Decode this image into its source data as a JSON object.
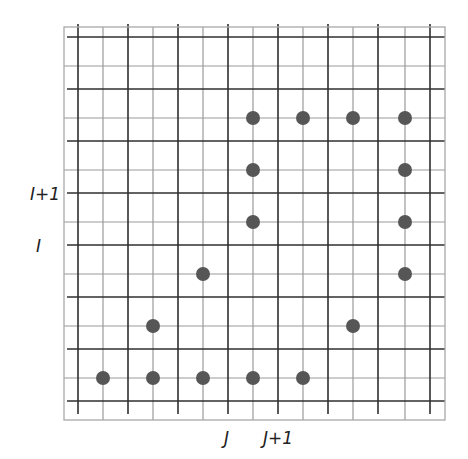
{
  "diagram": {
    "type": "staggered-grid",
    "colors": {
      "background": "#ffffff",
      "thick_line": "#2f2f2f",
      "thin_line": "#9a9a9a",
      "border": "#a8a8a8",
      "dot": "#565656",
      "label": "#222222"
    },
    "frame": {
      "x0": 64,
      "y0": 27,
      "x1": 445,
      "y1": 420
    },
    "thick_verticals_x": [
      78,
      128,
      178,
      228,
      278,
      328,
      378,
      430
    ],
    "thin_verticals_x": [
      103,
      153,
      203,
      253,
      303,
      353,
      405
    ],
    "thick_horizontals_y": [
      37,
      89,
      141,
      193,
      245,
      297,
      349,
      401
    ],
    "thin_horizontals_y": [
      66,
      118,
      170,
      222,
      274,
      326,
      378
    ],
    "dot_radius": 7,
    "dots": [
      {
        "x": 253,
        "y": 118
      },
      {
        "x": 303,
        "y": 118
      },
      {
        "x": 353,
        "y": 118
      },
      {
        "x": 405,
        "y": 118
      },
      {
        "x": 253,
        "y": 170
      },
      {
        "x": 405,
        "y": 170
      },
      {
        "x": 253,
        "y": 222
      },
      {
        "x": 405,
        "y": 222
      },
      {
        "x": 203,
        "y": 274
      },
      {
        "x": 405,
        "y": 274
      },
      {
        "x": 153,
        "y": 326
      },
      {
        "x": 353,
        "y": 326
      },
      {
        "x": 103,
        "y": 378
      },
      {
        "x": 153,
        "y": 378
      },
      {
        "x": 203,
        "y": 378
      },
      {
        "x": 253,
        "y": 378
      },
      {
        "x": 303,
        "y": 378
      }
    ],
    "labels": {
      "row_i_plus_1": "I+1",
      "row_i": "I",
      "col_j": "J",
      "col_j_plus_1": "J+1"
    }
  }
}
